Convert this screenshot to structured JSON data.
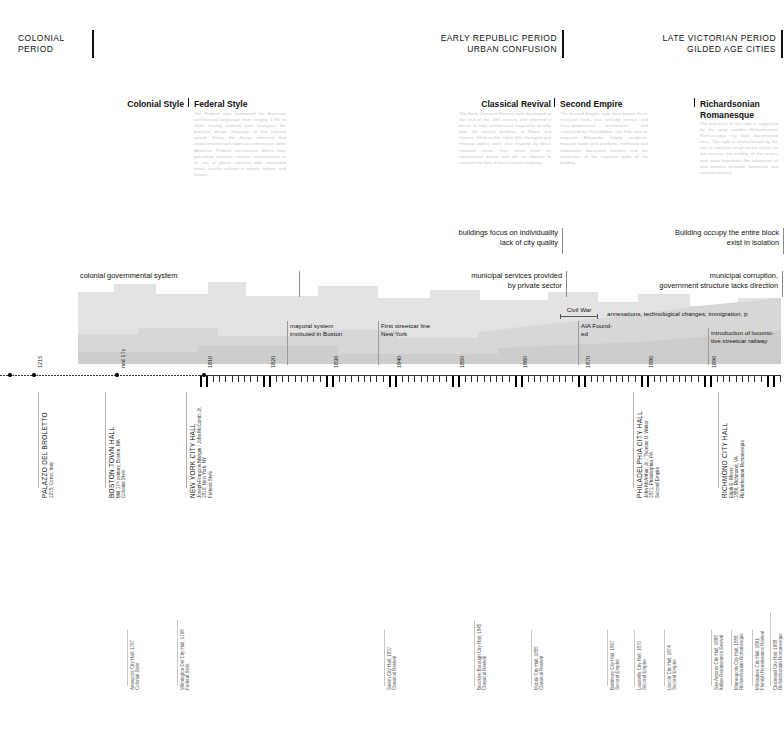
{
  "periods": [
    {
      "label1": "COLONIAL PERIOD",
      "label2": "",
      "x": 18,
      "y": 33,
      "bar_x": 92,
      "bar_h": 28,
      "align": "left"
    },
    {
      "label1": "EARLY REPUBLIC PERIOD",
      "label2": "URBAN CONFUSION",
      "x": 380,
      "y": 33,
      "bar_x": 562,
      "bar_h": 28,
      "align": "right"
    },
    {
      "label1": "LATE VICTORIAN PERIOD",
      "label2": "GILDED AGE CITIES",
      "x": 600,
      "y": 33,
      "bar_x": 781,
      "bar_h": 28,
      "align": "right"
    }
  ],
  "styles": [
    {
      "name": "Colonial Style",
      "x": 118,
      "y": 99,
      "align": "right",
      "width": 66,
      "rule": false,
      "body": ""
    },
    {
      "name": "Federal Style",
      "x": 194,
      "y": 99,
      "align": "left",
      "width": 92,
      "rule": true,
      "body": "The Federal style dominated the American architectural landscape from roughly 1780 to 1840, having evolved from Georgian, the principal design language of the colonial period. Today, the design elements that characterized each styles are interwoven, while American Federal architecture differs from preceding Georgian colonial interpretations in its use of planar surfaces with attenuated detail, usually collated in panels, tablets, and friezes."
    },
    {
      "name": "Classical Revival",
      "x": 459,
      "y": 99,
      "align": "right",
      "width": 92,
      "rule": false,
      "body": "The Early Classical Revival style developed at the end of the 18th century and reflected a desire to take architectural inspiration directly from the ancient buildings of Rome and Greece. While earlier styles (the Georgian and Federal styles) were also inspired by these classical forms, they relied more on architectural details and did not attempt to recreate the look of those ancient buildings."
    },
    {
      "name": "Second Empire",
      "x": 560,
      "y": 99,
      "align": "left",
      "width": 88,
      "rule": true,
      "body": "The Second Empire style, best known for its mansard roofs, was critically intense and three-dimensional architecture, well expressed by Philadelphia City Hall, with its exquisite Alexander Calder sculpture, massive tower and pavilions, multistory and elaborately decorated interiors and the integration of the separate parts of the building."
    },
    {
      "name": "Richardsonian Romanesque",
      "x": 700,
      "y": 99,
      "align": "left",
      "width": 78,
      "rule": true,
      "body": "The popularity of this style is suggested by the large number Richardsonian Romanesque city halls documented here. The style is characterized by the use of massive, rough-faced stones on the exterior, the solidity of the arches and, most important, the integration of and balance between horizontal and vertical massing."
    }
  ],
  "notes": [
    {
      "lines": [
        "buildings focus on individuality",
        "lack of city quality"
      ],
      "x": 310,
      "y": 228,
      "w": 248,
      "tick_h": 26
    },
    {
      "lines": [
        "Building occupy the entire block",
        "exist in isolation"
      ],
      "x": 520,
      "y": 228,
      "w": 259,
      "tick_h": 26
    },
    {
      "lines": [
        "colonial governmental system",
        "",
        ""
      ],
      "x": 80,
      "y": 271,
      "w": 215,
      "tick_h": 26,
      "align": "left"
    },
    {
      "lines": [
        "municipal services provided",
        "by private sector"
      ],
      "x": 330,
      "y": 271,
      "w": 232,
      "tick_h": 26
    },
    {
      "lines": [
        "municipal corruption,",
        "government structure lacks direction"
      ],
      "x": 540,
      "y": 271,
      "w": 238,
      "tick_h": 26
    }
  ],
  "events": [
    {
      "lines": [
        "mayoral system",
        "instituted in Boston"
      ],
      "x": 290,
      "y": 322,
      "h": 44
    },
    {
      "lines": [
        "First streetcar line",
        "New York"
      ],
      "x": 381,
      "y": 322,
      "h": 44
    },
    {
      "lines": [
        "AIA Found-",
        "ed"
      ],
      "x": 581,
      "y": 322,
      "h": 44
    },
    {
      "lines": [
        "annexations, technological changes, immigration, p"
      ],
      "x": 607,
      "y": 310,
      "h": 0
    },
    {
      "lines": [
        "introduction of locomo-",
        "tive streetcar railway"
      ],
      "x": 711,
      "y": 329,
      "h": 37
    }
  ],
  "civil_war": {
    "label": "Civil War",
    "x": 560,
    "y": 306,
    "w": 38
  },
  "axis": {
    "year_labels": [
      {
        "text": "1215",
        "x": 34
      },
      {
        "text": "mid 17c",
        "x": 117
      },
      {
        "text": "1810",
        "x": 204
      },
      {
        "text": "1820",
        "x": 267
      },
      {
        "text": "1830",
        "x": 330
      },
      {
        "text": "1840",
        "x": 393
      },
      {
        "text": "1850",
        "x": 456
      },
      {
        "text": "1860",
        "x": 519
      },
      {
        "text": "1870",
        "x": 582
      },
      {
        "text": "1880",
        "x": 645
      },
      {
        "text": "1890",
        "x": 708
      }
    ],
    "dots": [
      10,
      34,
      117,
      204
    ]
  },
  "buildings": [
    {
      "title": "PALAZZO DEL BROLETTO",
      "sub": [
        "1215, Como, Italy"
      ],
      "x": 38,
      "lead_top": 392,
      "lead_h": 96,
      "label_y": 498
    },
    {
      "title": "BOSTON TOWN HALL",
      "sub": [
        "Mid 17ᵗʰ century, Boston, MA",
        "Colonial Style"
      ],
      "x": 105,
      "lead_top": 392,
      "lead_h": 96,
      "label_y": 498
    },
    {
      "title": "NEW YORK CITY HALL",
      "sub": [
        "Joseph-François Mangin / John McComb, Jr.",
        "1810, New York, NY",
        "Federal Style"
      ],
      "x": 186,
      "lead_top": 392,
      "lead_h": 96,
      "label_y": 498
    },
    {
      "title": "PHILADELPHIA CITY HALL",
      "sub": [
        "John McArthur, Jr. / Thomas U. Walter",
        "1871, Philadelphia, PA",
        "Second Empire"
      ],
      "x": 633,
      "lead_top": 392,
      "lead_h": 96,
      "label_y": 498
    },
    {
      "title": "RICHMOND CITY HALL",
      "sub": [
        "Elijah E. Myers",
        "1886, Richmond, VA",
        "Richardsonian Romanesque"
      ],
      "x": 718,
      "lead_top": 392,
      "lead_h": 96,
      "label_y": 498
    }
  ],
  "minor_buildings": [
    {
      "lines": [
        "Annapolis City Hall, 1767",
        "Colonial Style"
      ],
      "x": 127,
      "lead_top": 630,
      "lead_h": 56,
      "label_y": 690
    },
    {
      "lines": [
        "Wilmington Del City Hall, 1798",
        "Federal Style"
      ],
      "x": 177,
      "lead_top": 620,
      "lead_h": 66,
      "label_y": 690
    },
    {
      "lines": [
        "Salem City Hall, 1837",
        "Classical Revival"
      ],
      "x": 384,
      "lead_top": 630,
      "lead_h": 56,
      "label_y": 690
    },
    {
      "lines": [
        "Brooklyn Borough City Hall, 1845",
        "Classical Revival"
      ],
      "x": 474,
      "lead_top": 620,
      "lead_h": 66,
      "label_y": 690
    },
    {
      "lines": [
        "Mobile City Hall, 1855",
        "Classical Revival"
      ],
      "x": 531,
      "lead_top": 630,
      "lead_h": 56,
      "label_y": 690
    },
    {
      "lines": [
        "Baltimore City Hall, 1867",
        "Second Empire"
      ],
      "x": 607,
      "lead_top": 630,
      "lead_h": 56,
      "label_y": 690
    },
    {
      "lines": [
        "Louisville City Hall, 1870",
        "Second Empire"
      ],
      "x": 634,
      "lead_top": 630,
      "lead_h": 56,
      "label_y": 690
    },
    {
      "lines": [
        "Lincoln City Hall, 1874",
        "Second Empire"
      ],
      "x": 664,
      "lead_top": 630,
      "lead_h": 56,
      "label_y": 690
    },
    {
      "lines": [
        "San Antonio City Hall, 1888",
        "Italian Renaissance Revival"
      ],
      "x": 711,
      "lead_top": 630,
      "lead_h": 56,
      "label_y": 690
    },
    {
      "lines": [
        "Minneapolis City Hall, 1888",
        "Richardsonian Romanesque"
      ],
      "x": 731,
      "lead_top": 630,
      "lead_h": 56,
      "label_y": 690
    },
    {
      "lines": [
        "Milwaukee City Hall, 1891",
        "Flemish Renaissance Revival"
      ],
      "x": 752,
      "lead_top": 630,
      "lead_h": 56,
      "label_y": 690
    },
    {
      "lines": [
        "Cincinnati City Hall, 1888",
        "Richardsonian Romanesque"
      ],
      "x": 770,
      "lead_top": 612,
      "lead_h": 74,
      "label_y": 690
    }
  ],
  "colors": {
    "ink": "#111111",
    "body_text": "#c9c9c9",
    "skyline_fill": "#e3e3e3",
    "skyline_fill_dark": "#d2d2d2",
    "rule": "#8a8a8a"
  }
}
